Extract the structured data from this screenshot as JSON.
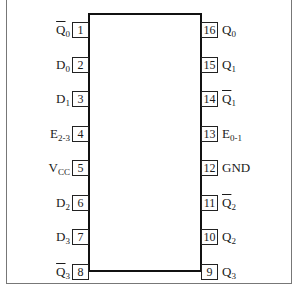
{
  "diagram": {
    "type": "IC pinout (16-pin DIP)",
    "left_pins": [
      {
        "num": "1",
        "name": "Q",
        "sub": "0",
        "bar": true
      },
      {
        "num": "2",
        "name": "D",
        "sub": "0",
        "bar": false
      },
      {
        "num": "3",
        "name": "D",
        "sub": "1",
        "bar": false
      },
      {
        "num": "4",
        "name": "E",
        "sub": "2-3",
        "bar": false
      },
      {
        "num": "5",
        "name": "V",
        "sub": "CC",
        "bar": false
      },
      {
        "num": "6",
        "name": "D",
        "sub": "2",
        "bar": false
      },
      {
        "num": "7",
        "name": "D",
        "sub": "3",
        "bar": false
      },
      {
        "num": "8",
        "name": "Q",
        "sub": "3",
        "bar": true
      }
    ],
    "right_pins": [
      {
        "num": "16",
        "name": "Q",
        "sub": "0",
        "bar": false
      },
      {
        "num": "15",
        "name": "Q",
        "sub": "1",
        "bar": false
      },
      {
        "num": "14",
        "name": "Q",
        "sub": "1",
        "bar": true
      },
      {
        "num": "13",
        "name": "E",
        "sub": "0-1",
        "bar": false
      },
      {
        "num": "12",
        "name": "GND",
        "sub": "",
        "bar": false
      },
      {
        "num": "11",
        "name": "Q",
        "sub": "2",
        "bar": true
      },
      {
        "num": "10",
        "name": "Q",
        "sub": "2",
        "bar": false
      },
      {
        "num": "9",
        "name": "Q",
        "sub": "3",
        "bar": false
      }
    ]
  }
}
